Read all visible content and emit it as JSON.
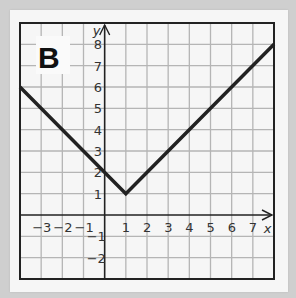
{
  "panel_label": "B",
  "chart_data": {
    "type": "line",
    "title": "B",
    "xlabel": "x",
    "ylabel": "y",
    "xlim": [
      -4,
      8
    ],
    "ylim": [
      -3,
      9
    ],
    "grid": true,
    "x_ticks": [
      -3,
      -2,
      -1,
      1,
      2,
      3,
      4,
      5,
      6,
      7
    ],
    "y_ticks": [
      -2,
      -1,
      1,
      2,
      3,
      4,
      5,
      6,
      7,
      8
    ],
    "series": [
      {
        "name": "absolute value graph",
        "x": [
          -4,
          1,
          8
        ],
        "y": [
          6,
          1,
          8
        ]
      }
    ],
    "vertex": [
      1,
      1
    ],
    "y_intercept": 2
  },
  "colors": {
    "grid": "#b5b5b5",
    "line": "#222222",
    "axis": "#222222",
    "background": "#fafafa"
  }
}
